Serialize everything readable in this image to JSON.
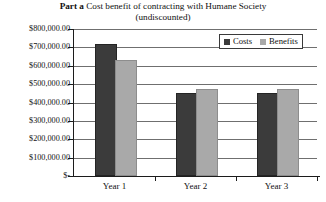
{
  "chart_data": {
    "type": "bar",
    "title": "Part a Cost benefit of contracting with Humane Society (undiscounted)",
    "title_lead": "Part a",
    "title_line1_rest": " Cost benefit of contracting with Humane Society",
    "title_line2": "(undiscounted)",
    "categories": [
      "Year 1",
      "Year 2",
      "Year 3"
    ],
    "series": [
      {
        "name": "Costs",
        "color": "#3b3b3b",
        "values": [
          705000,
          440000,
          440000
        ]
      },
      {
        "name": "Benefits",
        "color": "#a9a9a9",
        "values": [
          620000,
          465000,
          465000
        ]
      }
    ],
    "xlabel": "",
    "ylabel": "",
    "ylim": [
      0,
      800000
    ],
    "ytick_values": [
      800000,
      700000,
      600000,
      500000,
      400000,
      300000,
      200000,
      100000,
      0
    ],
    "ytick_labels": [
      "$800,000.00",
      "$700,000.00",
      "$600,000.00",
      "$500,000.00",
      "$400,000.00",
      "$300,000.00",
      "$200,000.00",
      "$100,000.00",
      "$-"
    ],
    "grid": true,
    "legend_position": "top-right",
    "legend_entries": [
      "Costs",
      "Benefits"
    ]
  }
}
